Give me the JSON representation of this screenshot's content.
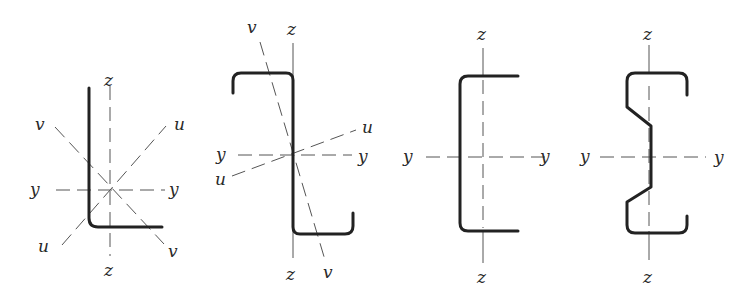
{
  "figure": {
    "sections": [
      {
        "name": "angle-section",
        "labels": {
          "z_top": "z",
          "z_bottom": "z",
          "y_left": "y",
          "y_right": "y",
          "u_top": "u",
          "u_bottom": "u",
          "v_top": "v",
          "v_bottom": "v"
        }
      },
      {
        "name": "z-section",
        "labels": {
          "z_top": "z",
          "z_bottom": "z",
          "y_left": "y",
          "y_right": "y",
          "u_top": "u",
          "u_bottom": "u",
          "v_top": "v",
          "v_bottom": "v"
        }
      },
      {
        "name": "channel-section",
        "labels": {
          "z_top": "z",
          "z_bottom": "z",
          "y_left": "y",
          "y_right": "y"
        }
      },
      {
        "name": "sigma-section",
        "labels": {
          "z_top": "z",
          "z_bottom": "z",
          "y_left": "y",
          "y_right": "y"
        }
      }
    ],
    "colors": {
      "stroke": "#222222",
      "axis": "#555555",
      "background": "#ffffff"
    }
  }
}
